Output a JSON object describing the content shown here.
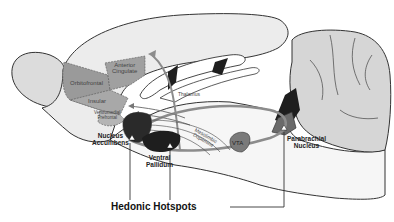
{
  "diagram": {
    "type": "brain sagittal section schematic",
    "colors": {
      "outline": "#333333",
      "cortex_fill": "#dcdcdc",
      "prefrontal_fill": "#9a9a9a",
      "cerebellum_fill": "#d2d2d2",
      "pathway": "#8c8c8c",
      "dark_region": "#1e1e1e",
      "vta_fill": "#7a7a7a"
    },
    "regions": {
      "anterior_cingulate": {
        "line1": "Anterior",
        "line2": "Cingulate"
      },
      "orbitofrontal": "Orbitofrontal",
      "insular": "Insular",
      "ventromedial": {
        "line1": "Ventromedial",
        "line2": "Prefrontal"
      },
      "nucleus_accumbens": {
        "line1": "Nucleus",
        "line2": "Accumbens"
      },
      "ventral_pallidum": {
        "line1": "Ventral",
        "line2": "Pallidum"
      },
      "thalamus": "Thalamus",
      "mesolimbic": {
        "line1": "Mesolimbic",
        "line2": "Dopamine"
      },
      "vta": "VTA",
      "parabrachial": {
        "line1": "Parabrachial",
        "line2": "Nucleus"
      }
    },
    "callout": "Hedonic Hotspots"
  }
}
